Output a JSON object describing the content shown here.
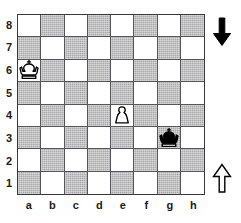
{
  "diagram": {
    "type": "chess-position",
    "colors": {
      "light_square": "#ffffff",
      "dark_square": "#a9a9ab",
      "border": "#3a3a3a",
      "grid_line": "#55555a",
      "label_text": "#1a1a1a",
      "black_piece": "#000000",
      "white_piece": "#ffffff"
    }
  },
  "board": {
    "files": [
      "a",
      "b",
      "c",
      "d",
      "e",
      "f",
      "g",
      "h"
    ],
    "ranks": [
      "8",
      "7",
      "6",
      "5",
      "4",
      "3",
      "2",
      "1"
    ],
    "light_square_top_left": true,
    "squares": [
      [
        "light",
        "dark",
        "light",
        "dark",
        "light",
        "dark",
        "light",
        "dark"
      ],
      [
        "dark",
        "light",
        "dark",
        "light",
        "dark",
        "light",
        "dark",
        "light"
      ],
      [
        "light",
        "dark",
        "light",
        "dark",
        "light",
        "dark",
        "light",
        "dark"
      ],
      [
        "dark",
        "light",
        "dark",
        "light",
        "dark",
        "light",
        "dark",
        "light"
      ],
      [
        "light",
        "dark",
        "light",
        "dark",
        "light",
        "dark",
        "light",
        "dark"
      ],
      [
        "dark",
        "light",
        "dark",
        "light",
        "dark",
        "light",
        "dark",
        "light"
      ],
      [
        "light",
        "dark",
        "light",
        "dark",
        "light",
        "dark",
        "light",
        "dark"
      ],
      [
        "dark",
        "light",
        "dark",
        "light",
        "dark",
        "light",
        "dark",
        "light"
      ]
    ],
    "pieces": [
      {
        "square": "a6",
        "file": "a",
        "rank": "6",
        "color": "white",
        "type": "king",
        "symbol": "♔",
        "name": "white-king"
      },
      {
        "square": "e4",
        "file": "e",
        "rank": "4",
        "color": "white",
        "type": "pawn",
        "symbol": "♙",
        "name": "white-pawn"
      },
      {
        "square": "g3",
        "file": "g",
        "rank": "3",
        "color": "black",
        "type": "king",
        "symbol": "♚",
        "name": "black-king"
      }
    ]
  },
  "arrows": [
    {
      "id": "arrow-black-down",
      "direction": "down",
      "fill": "black",
      "name": "black-to-move-arrow-down",
      "label": "↓"
    },
    {
      "id": "arrow-white-up",
      "direction": "up",
      "fill": "white",
      "name": "white-to-move-arrow-up",
      "label": "↑"
    }
  ]
}
